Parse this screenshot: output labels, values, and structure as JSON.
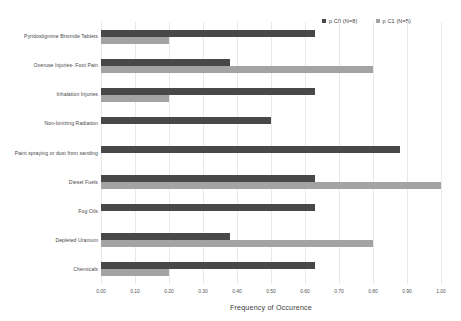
{
  "chart_data": {
    "type": "bar",
    "orientation": "horizontal",
    "title": "",
    "xlabel": "Frequency of Occurence",
    "ylabel": "",
    "xlim": [
      0.0,
      1.0
    ],
    "xticks": [
      "0.00",
      "0.10",
      "0.20",
      "0.30",
      "0.40",
      "0.50",
      "0.60",
      "0.70",
      "0.80",
      "0.90",
      "1.00"
    ],
    "xtick_values": [
      0.0,
      0.1,
      0.2,
      0.3,
      0.4,
      0.5,
      0.6,
      0.7,
      0.8,
      0.9,
      1.0
    ],
    "grid": true,
    "grid_axis": "x",
    "legend_position": "top-right",
    "categories": [
      "Pyridostigmine Bromide Tablets",
      "Overuse Injuries- Foot Pain",
      "Inhalation Injuries",
      "Non-Ionizing Radiation",
      "Paint spraying or dust from sanding",
      "Diesel Fuels",
      "Fog Oils",
      "Depleted Uranium",
      "Chemicals"
    ],
    "series": [
      {
        "name": "p C0 (N=8)",
        "color": "#484848",
        "values": [
          0.63,
          0.38,
          0.63,
          0.5,
          0.88,
          0.63,
          0.63,
          0.38,
          0.63
        ]
      },
      {
        "name": "p C1 (N=5)",
        "color": "#a3a3a3",
        "values": [
          0.2,
          0.8,
          0.2,
          0.0,
          0.0,
          1.0,
          0.0,
          0.8,
          0.2
        ]
      }
    ]
  },
  "legend": {
    "entries": [
      {
        "label": "p C0 (N=8)",
        "color": "#484848"
      },
      {
        "label": "p C1 (N=5)",
        "color": "#a3a3a3"
      }
    ]
  },
  "axis": {
    "x_title": "Frequency of Occurence"
  }
}
